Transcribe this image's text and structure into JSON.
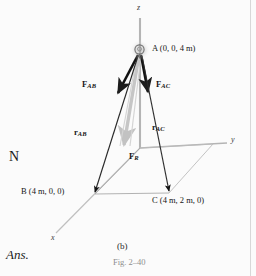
{
  "figure": {
    "caption_part": "(b)",
    "caption_fig": "Fig. 2–40",
    "axes": {
      "z": "z",
      "y": "y",
      "x": "x"
    },
    "points": [
      {
        "id": "A",
        "name": "A",
        "coords": "(0, 0, 4 m)",
        "label": "A (0, 0, 4 m)"
      },
      {
        "id": "B",
        "name": "B",
        "coords": "(4 m, 0, 0)",
        "label": "B (4 m, 0, 0)"
      },
      {
        "id": "C",
        "name": "C",
        "coords": "(4 m, 2 m, 0)",
        "label": "C (4 m, 2 m, 0)"
      }
    ],
    "vectors": [
      {
        "id": "F_AB",
        "symbol": "F",
        "subscript": "AB",
        "kind": "force",
        "color": "#121212"
      },
      {
        "id": "F_AC",
        "symbol": "F",
        "subscript": "AC",
        "kind": "force",
        "color": "#121212"
      },
      {
        "id": "F_R",
        "symbol": "F",
        "subscript": "R",
        "kind": "resultant-force",
        "color": "#b9b9b9"
      },
      {
        "id": "r_AB",
        "symbol": "r",
        "subscript": "AB",
        "kind": "position",
        "color": "#2a2a2a"
      },
      {
        "id": "r_AC",
        "symbol": "r",
        "subscript": "AC",
        "kind": "position",
        "color": "#2a2a2a"
      }
    ],
    "icons": {
      "ring_at_A": "ring-hook-icon"
    }
  },
  "margin": {
    "unit_text": "N",
    "ans_text": "Ans."
  },
  "colors": {
    "axis": "#b4b4b4",
    "force_arrow": "#121212",
    "position_arrow": "#2a2a2a",
    "resultant_arrow": "#bfbfbf",
    "base_outline": "#a9a9a9",
    "page_background": "#fbfbfb",
    "caption_gray": "#8e8e8e"
  }
}
